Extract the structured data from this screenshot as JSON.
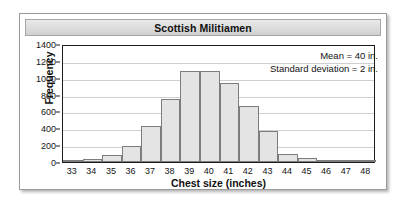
{
  "figure": {
    "title": "Scottish Militiamen"
  },
  "chart_data": {
    "type": "bar",
    "title": "Scottish Militiamen",
    "xlabel": "Chest size (inches)",
    "ylabel": "Frequency",
    "categories": [
      "33",
      "34",
      "35",
      "36",
      "37",
      "38",
      "39",
      "40",
      "41",
      "42",
      "43",
      "44",
      "45",
      "46",
      "47",
      "48"
    ],
    "values": [
      3,
      30,
      80,
      185,
      425,
      750,
      1075,
      1080,
      935,
      660,
      370,
      90,
      45,
      25,
      5,
      2
    ],
    "xlim": [
      32.5,
      48.5
    ],
    "ylim": [
      0,
      1400
    ],
    "yticks": [
      0,
      200,
      400,
      600,
      800,
      1000,
      1200,
      1400
    ],
    "grid": true,
    "legend": "none",
    "annotations": [
      "Mean = 40 in.",
      "Standard deviation = 2 in."
    ],
    "bar_fill_color": "#e4e4e4",
    "bar_edge_color": "#7d7d7d",
    "gridline_color": "#cfcfcf",
    "axis_color": "#1d1d1d"
  }
}
